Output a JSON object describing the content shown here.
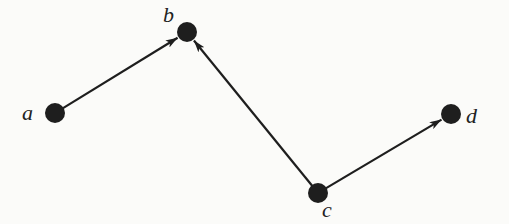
{
  "diagram": {
    "type": "directed-graph",
    "colors": {
      "node": "#1e1e1e",
      "edge": "#1e1e1e",
      "label": "#222222",
      "background": "#fbfbf9"
    },
    "nodes": [
      {
        "id": "a",
        "label": "a",
        "x": 55,
        "y": 113,
        "label_x": 22,
        "label_y": 100
      },
      {
        "id": "b",
        "label": "b",
        "x": 187,
        "y": 32,
        "label_x": 163,
        "label_y": 2
      },
      {
        "id": "c",
        "label": "c",
        "x": 318,
        "y": 193,
        "label_x": 322,
        "label_y": 197
      },
      {
        "id": "d",
        "label": "d",
        "x": 451,
        "y": 114,
        "label_x": 466,
        "label_y": 103
      }
    ],
    "edges": [
      {
        "from": "a",
        "to": "b"
      },
      {
        "from": "c",
        "to": "b"
      },
      {
        "from": "c",
        "to": "d"
      }
    ]
  }
}
